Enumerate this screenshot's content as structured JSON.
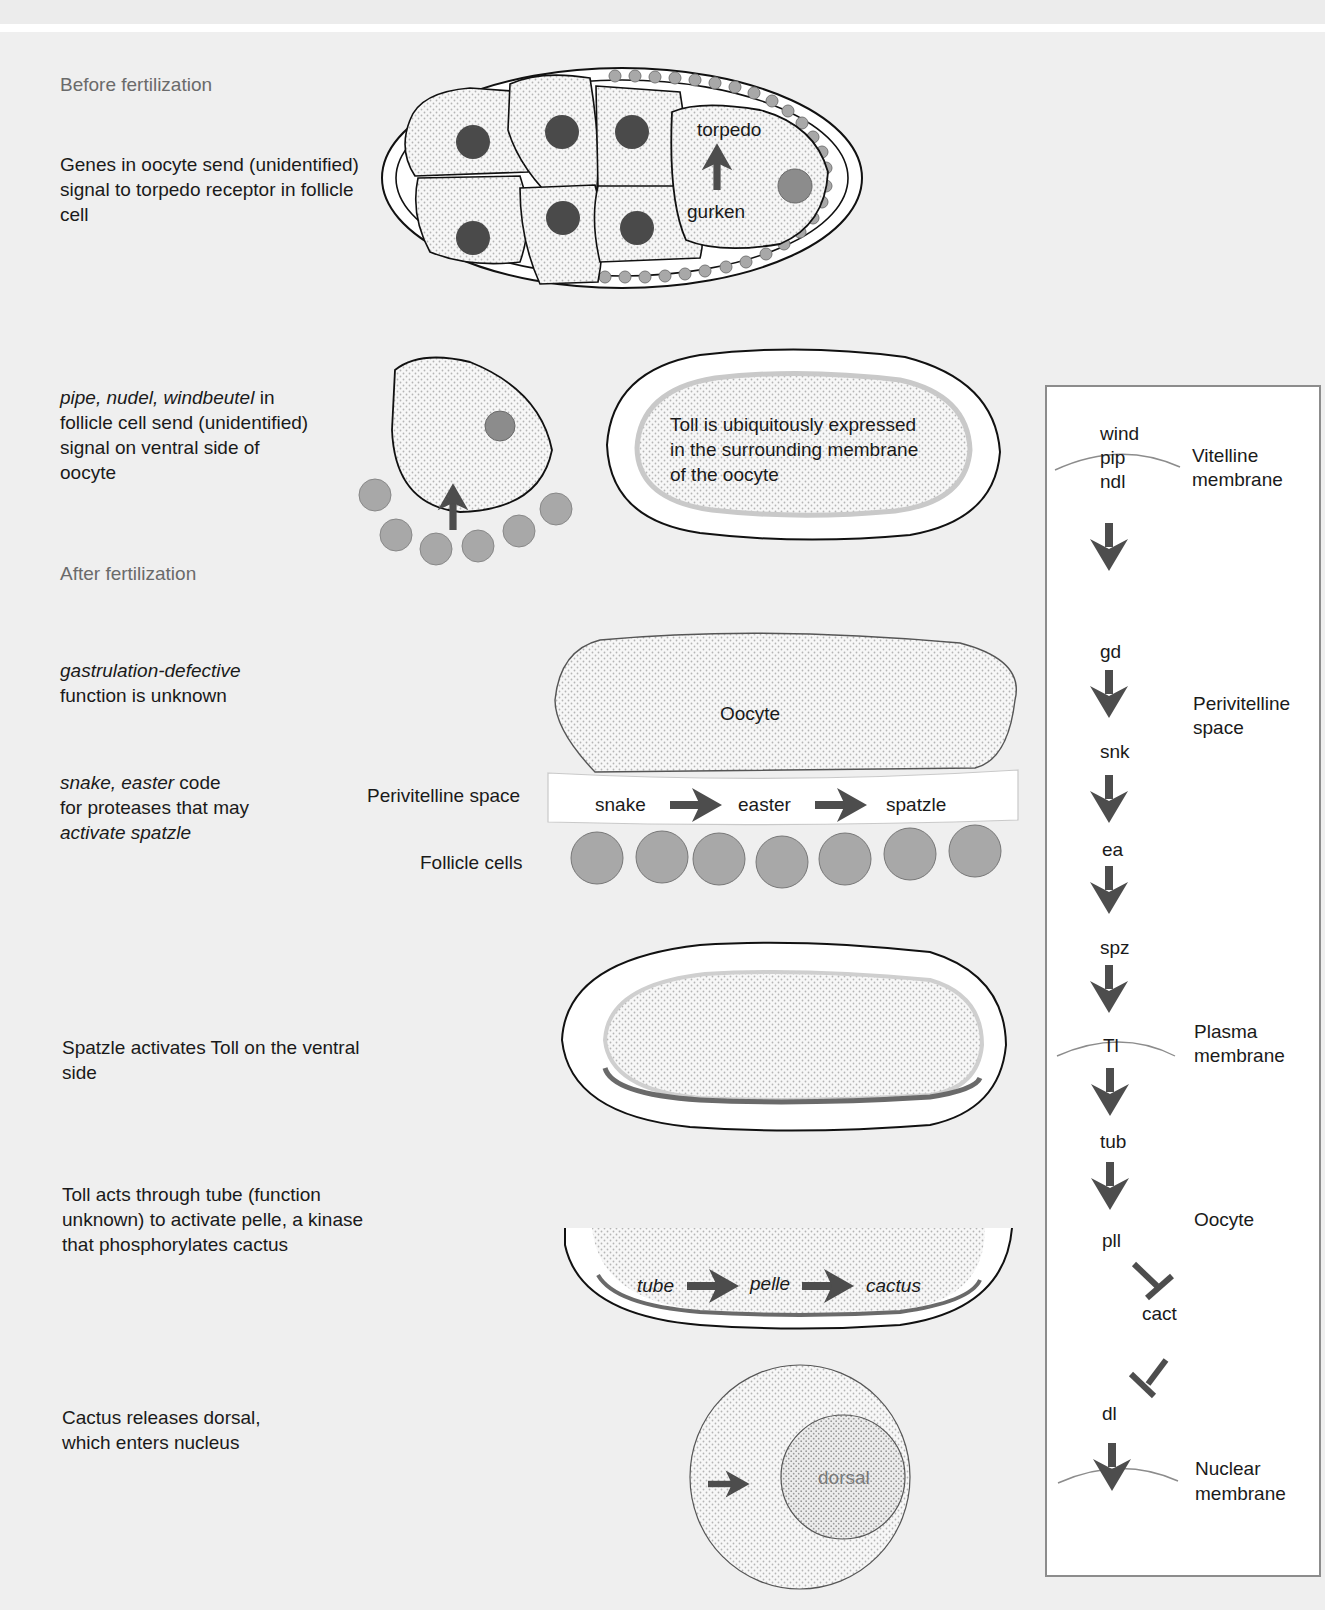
{
  "sections": {
    "before": "Before fertilization",
    "after": "After fertilization"
  },
  "descriptions": {
    "d1": [
      "Genes in oocyte send (unidentified)",
      "signal to torpedo receptor in follicle",
      "cell"
    ],
    "d2": {
      "italic": "pipe, nudel, windbeutel",
      "rest1": " in",
      "line2": "follicle cell send (unidentified)",
      "line3": "signal on ventral side of",
      "line4": "oocyte"
    },
    "d3": {
      "italic": "gastrulation-defective",
      "line2": "function is unknown"
    },
    "d4": {
      "italic": "snake, easter",
      "rest1": " code",
      "line2": "for proteases that may",
      "italic3": "activate spatzle"
    },
    "d5": [
      "Spatzle activates Toll on the ventral",
      "side"
    ],
    "d6": [
      "Toll acts through tube (function",
      "unknown) to activate pelle, a kinase",
      "that phosphorylates cactus"
    ],
    "d7": [
      "Cactus releases dorsal,",
      "which enters nucleus"
    ]
  },
  "egg_chamber": {
    "receptor": "torpedo",
    "ligand": "gurken"
  },
  "toll_embryo": {
    "text": [
      "Toll is ubiquitously expressed",
      "in the surrounding membrane",
      "of the oocyte"
    ]
  },
  "perivitelline_diagram": {
    "oocyte": "Oocyte",
    "space_label": "Perivitelline space",
    "follicle_label": "Follicle cells",
    "cascade": [
      "snake",
      "easter",
      "spatzle"
    ]
  },
  "intracellular": {
    "cascade": [
      "tube",
      "pelle",
      "cactus"
    ]
  },
  "nucleus": {
    "label": "dorsal"
  },
  "pathway": {
    "genes": [
      "wind",
      "pip",
      "ndl",
      "gd",
      "snk",
      "ea",
      "spz",
      "Tl",
      "tub",
      "pll",
      "cact",
      "dl"
    ],
    "compartments": {
      "vitelline": [
        "Vitelline",
        "membrane"
      ],
      "perivitelline": [
        "Perivitelline",
        "space"
      ],
      "plasma": [
        "Plasma",
        "membrane"
      ],
      "oocyte": "Oocyte",
      "nuclear": [
        "Nuclear",
        "membrane"
      ]
    }
  },
  "colors": {
    "background": "#efefef",
    "nucleus_dark": "#4a4a4a",
    "follicle_gray": "#a8a8a8",
    "arrow": "#4d4d4d",
    "toll_ventral": "#6a6a6a",
    "border": "#8c8c8c"
  }
}
